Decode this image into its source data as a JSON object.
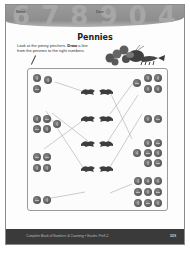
{
  "header": {
    "name_label": "Name",
    "date_label": "Date",
    "decor_digits": "6 7 8 9 0 4"
  },
  "title": "Pennies",
  "instructions": {
    "lead": "Look at the penny pinchers. ",
    "bold": "Draw",
    "rest": " a line from the pennies to the right numbers."
  },
  "mascot": "lobster-with-pennies",
  "exercise": {
    "left_groups": [
      {
        "count": 3
      },
      {
        "count": 5
      },
      {
        "count": 4
      },
      {
        "count": 2
      }
    ],
    "right_groups": [
      {
        "count": 5
      },
      {
        "count": 2
      },
      {
        "count": 7
      },
      {
        "count": 9
      }
    ],
    "center_numbers": [
      "number-crab-1",
      "number-crab-2",
      "number-crab-3",
      "number-crab-4"
    ]
  },
  "footer": {
    "book_title": "Complete Book of Numbers & Counting • Grades PreK-1",
    "page_number": "329"
  },
  "colors": {
    "header_band": "#8d8d8d",
    "footer_band": "#3a3a3a",
    "coin": "#5d5d5d"
  }
}
